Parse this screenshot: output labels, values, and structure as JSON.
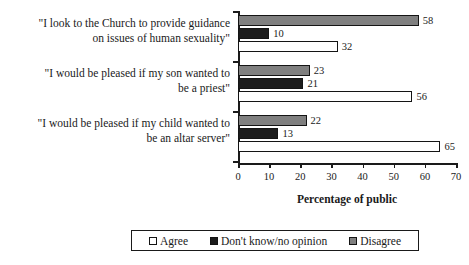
{
  "clipped_header_text": "",
  "chart_data": {
    "type": "bar",
    "orientation": "horizontal",
    "title": "",
    "xlabel": "Percentage of public",
    "ylabel": "",
    "xlim": [
      0,
      70
    ],
    "xticks": [
      0,
      10,
      20,
      30,
      40,
      50,
      60,
      70
    ],
    "grid": false,
    "legend_position": "bottom",
    "categories": [
      "\"I look to the Church to provide guidance on issues of human sexuality\"",
      "\"I would be pleased if my son wanted to be a priest\"",
      "\"I would be pleased if my child wanted to be an altar server\""
    ],
    "series": [
      {
        "name": "Agree",
        "color": "#ffffff",
        "values": [
          32,
          56,
          65
        ]
      },
      {
        "name": "Don't know/no opinion",
        "color": "#1c1c1c",
        "values": [
          10,
          21,
          13
        ]
      },
      {
        "name": "Disagree",
        "color": "#7f7f7f",
        "values": [
          58,
          23,
          22
        ]
      }
    ]
  },
  "categories_display": [
    {
      "line1": "\"I look to the Church to provide guidance",
      "line2": "on issues of human sexuality\""
    },
    {
      "line1": "\"I would be pleased if my son wanted to",
      "line2": "be a priest\""
    },
    {
      "line1": "\"I would be pleased if my child wanted to",
      "line2": "be an altar server\""
    }
  ],
  "axis": {
    "x_title": "Percentage of public",
    "x_tick_labels": [
      "0",
      "10",
      "20",
      "30",
      "40",
      "50",
      "60",
      "70"
    ]
  },
  "legend": {
    "items": [
      {
        "label": "Agree",
        "swatch": "agree"
      },
      {
        "label": "Don't know/no opinion",
        "swatch": "dontknow"
      },
      {
        "label": "Disagree",
        "swatch": "disagree"
      }
    ]
  },
  "bar_values": {
    "g0": {
      "disagree": "58",
      "dontknow": "10",
      "agree": "32"
    },
    "g1": {
      "disagree": "23",
      "dontknow": "21",
      "agree": "56"
    },
    "g2": {
      "disagree": "22",
      "dontknow": "13",
      "agree": "65"
    }
  }
}
